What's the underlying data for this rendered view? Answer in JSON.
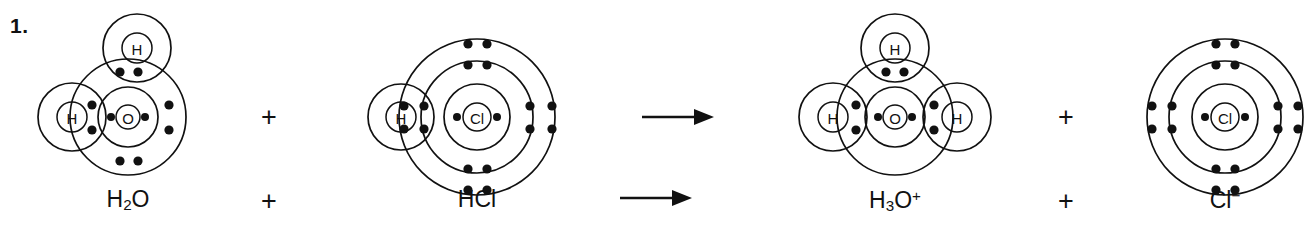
{
  "page": {
    "background_color": "#ffffff",
    "ink_color": "#111111",
    "width": 1311,
    "height": 241
  },
  "question": {
    "number_label": "1."
  },
  "equation": {
    "operators": [
      {
        "name": "plus-1",
        "symbol": "+",
        "x": 268,
        "y": 105
      },
      {
        "name": "arrow-1",
        "symbol": "→",
        "x": 650,
        "y": 105
      },
      {
        "name": "plus-2",
        "symbol": "+",
        "x": 1065,
        "y": 105
      }
    ],
    "caption_operators": [
      {
        "name": "caption-plus-1",
        "symbol": "+",
        "x": 268,
        "y": 198
      },
      {
        "name": "caption-arrow-1",
        "symbol": "→",
        "x": 650,
        "y": 198
      },
      {
        "name": "caption-plus-2",
        "symbol": "+",
        "x": 1065,
        "y": 198
      }
    ]
  },
  "species": [
    {
      "id": "water",
      "name": "water-molecule",
      "formula_html": "H<sub>2</sub>O",
      "formula_text": "H2O",
      "center_atom": "O",
      "hydrogens": 2,
      "charge": "",
      "label_x": 128,
      "label_y": 198
    },
    {
      "id": "hydrogen-chloride",
      "name": "hydrogen-chloride-molecule",
      "formula_html": "HCl",
      "formula_text": "HCl",
      "center_atom": "Cl",
      "hydrogens": 1,
      "charge": "",
      "label_x": 477,
      "label_y": 198
    },
    {
      "id": "hydronium",
      "name": "hydronium-ion",
      "formula_html": "H<sub>3</sub>O<sup>+</sup>",
      "formula_text": "H3O+",
      "center_atom": "O",
      "hydrogens": 3,
      "charge": "+",
      "label_x": 895,
      "label_y": 198
    },
    {
      "id": "chloride",
      "name": "chloride-ion",
      "formula_html": "Cl<sup>−</sup>",
      "formula_text": "Cl-",
      "center_atom": "Cl",
      "hydrogens": 0,
      "charge": "−",
      "label_x": 1225,
      "label_y": 198
    }
  ],
  "chart_data": {
    "type": "diagram",
    "reaction_text": "H2O + HCl → H3O+ + Cl-",
    "diagrams": [
      {
        "id": "water",
        "label": "H2O",
        "central_atom": {
          "symbol": "O",
          "cx": 128,
          "cy": 117,
          "nucleus_r": 12
        },
        "shells": [
          {
            "r": 30,
            "electrons": 2
          },
          {
            "r": 58,
            "electrons": 8
          }
        ],
        "hydrogen_atoms": [
          {
            "symbol": "H",
            "cx": 137,
            "cy": 48,
            "nucleus_r": 16,
            "shell_r": 34,
            "position": "top"
          },
          {
            "symbol": "H",
            "cx": 72,
            "cy": 117,
            "nucleus_r": 16,
            "shell_r": 34,
            "position": "left"
          }
        ],
        "electron_dots": [
          {
            "cx": 111,
            "cy": 117,
            "r": 4,
            "shell": "inner"
          },
          {
            "cx": 145,
            "cy": 117,
            "r": 4,
            "shell": "inner"
          },
          {
            "cx": 120,
            "cy": 72,
            "r": 4.6,
            "shell": "outer",
            "pair": "top-bond"
          },
          {
            "cx": 138,
            "cy": 72,
            "r": 4.6,
            "shell": "outer",
            "pair": "top-bond"
          },
          {
            "cx": 92,
            "cy": 105,
            "r": 4.6,
            "shell": "outer",
            "pair": "left-bond"
          },
          {
            "cx": 92,
            "cy": 130,
            "r": 4.6,
            "shell": "outer",
            "pair": "left-bond"
          },
          {
            "cx": 169,
            "cy": 105,
            "r": 4.6,
            "shell": "outer",
            "pair": "lone-right"
          },
          {
            "cx": 169,
            "cy": 130,
            "r": 4.6,
            "shell": "outer",
            "pair": "lone-right"
          },
          {
            "cx": 120,
            "cy": 161,
            "r": 4.6,
            "shell": "outer",
            "pair": "lone-bottom"
          },
          {
            "cx": 138,
            "cy": 161,
            "r": 4.6,
            "shell": "outer",
            "pair": "lone-bottom"
          }
        ]
      },
      {
        "id": "hydrogen-chloride",
        "label": "HCl",
        "central_atom": {
          "symbol": "Cl",
          "cx": 477,
          "cy": 117,
          "nucleus_r": 14
        },
        "shells": [
          {
            "r": 33,
            "electrons": 2
          },
          {
            "r": 56,
            "electrons": 8
          },
          {
            "r": 78,
            "electrons": 8
          }
        ],
        "hydrogen_atoms": [
          {
            "symbol": "H",
            "cx": 401,
            "cy": 117,
            "nucleus_r": 16,
            "shell_r": 33,
            "position": "left"
          }
        ],
        "electron_dots": [
          {
            "cx": 457,
            "cy": 117,
            "r": 4,
            "shell": "inner"
          },
          {
            "cx": 497,
            "cy": 117,
            "r": 4,
            "shell": "inner"
          },
          {
            "cx": 468,
            "cy": 65,
            "r": 4.6,
            "shell": "middle"
          },
          {
            "cx": 487,
            "cy": 65,
            "r": 4.6,
            "shell": "middle"
          },
          {
            "cx": 468,
            "cy": 169,
            "r": 4.6,
            "shell": "middle"
          },
          {
            "cx": 487,
            "cy": 169,
            "r": 4.6,
            "shell": "middle"
          },
          {
            "cx": 424,
            "cy": 106,
            "r": 4.6,
            "shell": "middle"
          },
          {
            "cx": 424,
            "cy": 129,
            "r": 4.6,
            "shell": "middle"
          },
          {
            "cx": 530,
            "cy": 106,
            "r": 4.6,
            "shell": "middle"
          },
          {
            "cx": 530,
            "cy": 129,
            "r": 4.6,
            "shell": "middle"
          },
          {
            "cx": 468,
            "cy": 44,
            "r": 4.6,
            "shell": "outer"
          },
          {
            "cx": 487,
            "cy": 44,
            "r": 4.6,
            "shell": "outer"
          },
          {
            "cx": 468,
            "cy": 190,
            "r": 4.6,
            "shell": "outer"
          },
          {
            "cx": 487,
            "cy": 190,
            "r": 4.6,
            "shell": "outer"
          },
          {
            "cx": 404,
            "cy": 106,
            "r": 4.6,
            "shell": "outer",
            "pair": "h-bond"
          },
          {
            "cx": 404,
            "cy": 129,
            "r": 4.6,
            "shell": "outer",
            "pair": "h-bond"
          },
          {
            "cx": 552,
            "cy": 106,
            "r": 4.6,
            "shell": "outer"
          },
          {
            "cx": 552,
            "cy": 129,
            "r": 4.6,
            "shell": "outer"
          }
        ]
      },
      {
        "id": "hydronium",
        "label": "H3O+",
        "central_atom": {
          "symbol": "O",
          "cx": 895,
          "cy": 117,
          "nucleus_r": 12
        },
        "shells": [
          {
            "r": 30,
            "electrons": 2
          },
          {
            "r": 58,
            "electrons": 6
          }
        ],
        "hydrogen_atoms": [
          {
            "symbol": "H",
            "cx": 895,
            "cy": 48,
            "nucleus_r": 16,
            "shell_r": 34,
            "position": "top"
          },
          {
            "symbol": "H",
            "cx": 833,
            "cy": 117,
            "nucleus_r": 16,
            "shell_r": 34,
            "position": "left"
          },
          {
            "symbol": "H",
            "cx": 957,
            "cy": 117,
            "nucleus_r": 16,
            "shell_r": 34,
            "position": "right"
          }
        ],
        "electron_dots": [
          {
            "cx": 878,
            "cy": 117,
            "r": 4,
            "shell": "inner"
          },
          {
            "cx": 912,
            "cy": 117,
            "r": 4,
            "shell": "inner"
          },
          {
            "cx": 886,
            "cy": 72,
            "r": 4.6,
            "shell": "outer",
            "pair": "top-bond"
          },
          {
            "cx": 904,
            "cy": 72,
            "r": 4.6,
            "shell": "outer",
            "pair": "top-bond"
          },
          {
            "cx": 856,
            "cy": 105,
            "r": 4.6,
            "shell": "outer",
            "pair": "left-bond"
          },
          {
            "cx": 856,
            "cy": 130,
            "r": 4.6,
            "shell": "outer",
            "pair": "left-bond"
          },
          {
            "cx": 934,
            "cy": 105,
            "r": 4.6,
            "shell": "outer",
            "pair": "right-bond"
          },
          {
            "cx": 934,
            "cy": 130,
            "r": 4.6,
            "shell": "outer",
            "pair": "right-bond"
          }
        ]
      },
      {
        "id": "chloride",
        "label": "Cl-",
        "central_atom": {
          "symbol": "Cl",
          "cx": 1225,
          "cy": 117,
          "nucleus_r": 14
        },
        "shells": [
          {
            "r": 33,
            "electrons": 2
          },
          {
            "r": 56,
            "electrons": 8
          },
          {
            "r": 78,
            "electrons": 8
          }
        ],
        "hydrogen_atoms": [],
        "electron_dots": [
          {
            "cx": 1205,
            "cy": 117,
            "r": 4,
            "shell": "inner"
          },
          {
            "cx": 1245,
            "cy": 117,
            "r": 4,
            "shell": "inner"
          },
          {
            "cx": 1216,
            "cy": 65,
            "r": 4.6,
            "shell": "middle"
          },
          {
            "cx": 1235,
            "cy": 65,
            "r": 4.6,
            "shell": "middle"
          },
          {
            "cx": 1216,
            "cy": 169,
            "r": 4.6,
            "shell": "middle"
          },
          {
            "cx": 1235,
            "cy": 169,
            "r": 4.6,
            "shell": "middle"
          },
          {
            "cx": 1172,
            "cy": 106,
            "r": 4.6,
            "shell": "middle"
          },
          {
            "cx": 1172,
            "cy": 129,
            "r": 4.6,
            "shell": "middle"
          },
          {
            "cx": 1278,
            "cy": 106,
            "r": 4.6,
            "shell": "middle"
          },
          {
            "cx": 1278,
            "cy": 129,
            "r": 4.6,
            "shell": "middle"
          },
          {
            "cx": 1216,
            "cy": 44,
            "r": 4.6,
            "shell": "outer"
          },
          {
            "cx": 1235,
            "cy": 44,
            "r": 4.6,
            "shell": "outer"
          },
          {
            "cx": 1216,
            "cy": 190,
            "r": 4.6,
            "shell": "outer"
          },
          {
            "cx": 1235,
            "cy": 190,
            "r": 4.6,
            "shell": "outer"
          },
          {
            "cx": 1152,
            "cy": 106,
            "r": 4.6,
            "shell": "outer"
          },
          {
            "cx": 1152,
            "cy": 129,
            "r": 4.6,
            "shell": "outer"
          },
          {
            "cx": 1298,
            "cy": 106,
            "r": 4.6,
            "shell": "outer"
          },
          {
            "cx": 1298,
            "cy": 129,
            "r": 4.6,
            "shell": "outer"
          }
        ]
      }
    ]
  }
}
